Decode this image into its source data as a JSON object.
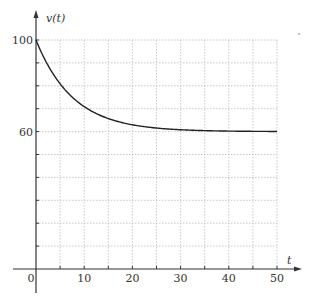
{
  "chart_data": {
    "type": "line",
    "title": "",
    "xlabel": "t",
    "ylabel": "v(t)",
    "xlim": [
      0,
      50
    ],
    "ylim": [
      0,
      100
    ],
    "x_ticks": [
      0,
      10,
      20,
      30,
      40,
      50
    ],
    "x_tick_labels": [
      "0",
      "10",
      "20",
      "30",
      "40",
      "50"
    ],
    "x_grid_step": 5,
    "y_ticks_labeled": [
      60,
      100
    ],
    "y_tick_labels": [
      "60",
      "100"
    ],
    "y_grid_step": 10,
    "grid": true,
    "legend": null,
    "series": [
      {
        "name": "v(t)",
        "description": "exponential decay from 100 toward asymptote 60",
        "formula": "v(t) = 60 + 40*exp(-0.13*t)",
        "x": [
          0,
          5,
          10,
          15,
          20,
          25,
          30,
          35,
          40,
          45,
          50
        ],
        "values": [
          100,
          81,
          71,
          66,
          63,
          61.5,
          60.8,
          60.4,
          60.2,
          60.1,
          60
        ]
      }
    ]
  },
  "colors": {
    "curve": "#222222",
    "axis": "#333333",
    "grid": "#bbbbbb"
  }
}
